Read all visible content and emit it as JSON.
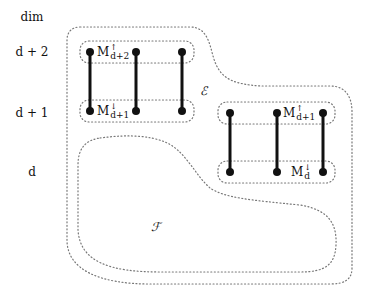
{
  "axis": {
    "title": "dim",
    "levels": [
      {
        "label": "d + 2",
        "y": 52
      },
      {
        "label": "d + 1",
        "y": 113
      },
      {
        "label": "d",
        "y": 172
      }
    ]
  },
  "regions": {
    "outer": {
      "label": "ℰ"
    },
    "inner": {
      "label": "ℱ"
    }
  },
  "groups": [
    {
      "name": "left",
      "top_label": {
        "base": "M",
        "sup": "↑",
        "sub": "d+2"
      },
      "bottom_label": {
        "base": "M",
        "sup": "↓",
        "sub": "d+1"
      }
    },
    {
      "name": "right",
      "top_label": {
        "base": "M",
        "sup": "↑",
        "sub": "d+1"
      },
      "bottom_label": {
        "base": "M",
        "sup": "↓",
        "sub": "d"
      }
    }
  ],
  "colors": {
    "edge": "#111111",
    "dotted": "#777777"
  }
}
